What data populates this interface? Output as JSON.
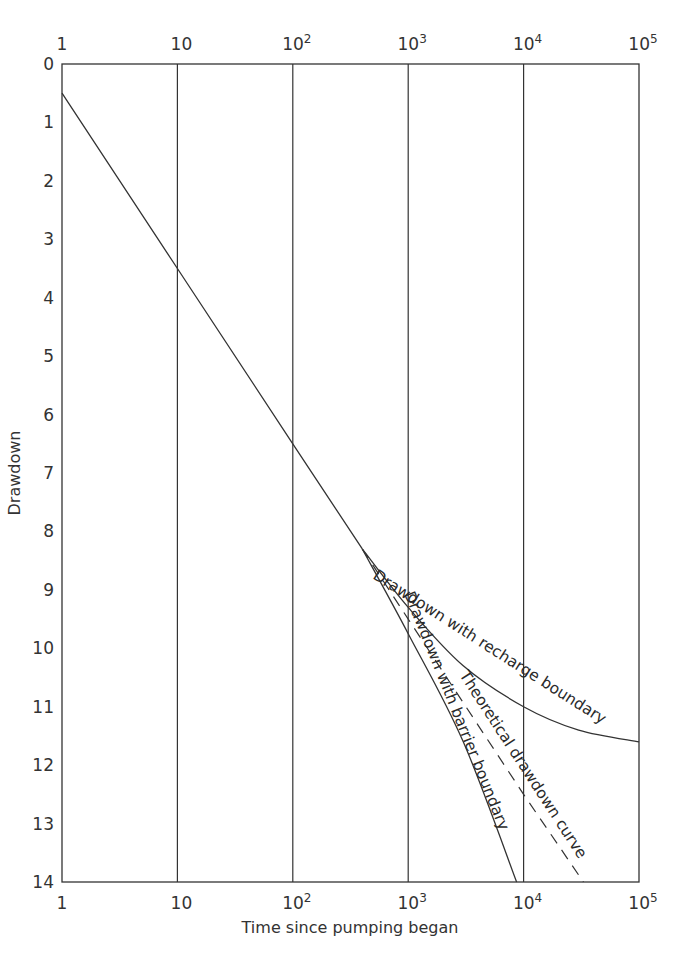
{
  "chart_data": {
    "type": "line",
    "title": "",
    "xlabel": "Time since pumping began",
    "ylabel": "Drawdown",
    "xscale": "log",
    "xlim": [
      1,
      100000
    ],
    "ylim": [
      0,
      14
    ],
    "y_inverted": true,
    "grid": "vertical lines at each decade",
    "x_ticks": [
      "1",
      "10",
      "10^2",
      "10^3",
      "10^4",
      "10^5"
    ],
    "x_tick_values": [
      1,
      10,
      100,
      1000,
      10000,
      100000
    ],
    "y_ticks": [
      0,
      1,
      2,
      3,
      4,
      5,
      6,
      7,
      8,
      9,
      10,
      11,
      12,
      13,
      14
    ],
    "series": [
      {
        "name": "Theoretical drawdown curve",
        "style": "solid to t≈400, dashed after",
        "x": [
          1,
          10,
          100,
          400,
          1000,
          10000,
          33000
        ],
        "values": [
          0.5,
          3.5,
          6.5,
          8.3,
          9.5,
          12.5,
          14.0
        ]
      },
      {
        "name": "Drawdown with recharge boundary",
        "style": "solid",
        "x": [
          400,
          1000,
          3000,
          10000,
          30000,
          100000
        ],
        "values": [
          8.3,
          9.3,
          10.3,
          11.0,
          11.4,
          11.6
        ]
      },
      {
        "name": "Drawdown with barrier boundary",
        "style": "solid",
        "x": [
          400,
          1000,
          3000,
          8700
        ],
        "values": [
          8.3,
          9.75,
          11.6,
          14.0
        ]
      }
    ],
    "annotations": [
      "Drawdown with recharge boundary",
      "Theoretical drawdown curve",
      "Drawdown with barrier boundary"
    ]
  },
  "labels": {
    "xlabel": "Time since pumping began",
    "ylabel": "Drawdown",
    "recharge": "Drawdown with recharge boundary",
    "theoretical": "Theoretical drawdown curve",
    "barrier": "Drawdown with barrier boundary"
  }
}
